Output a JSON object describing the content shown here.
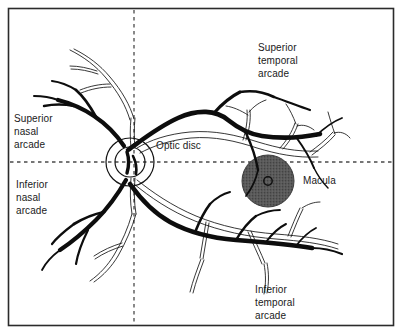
{
  "figure": {
    "border_color": "#2b2b2b",
    "background_color": "#ffffff",
    "vessel_color": "#111111",
    "dashed_line_color": "#4a4a4a",
    "macula_fill_color": "#5a5a5a",
    "text_color": "#1a1a1a"
  },
  "labels": {
    "superior_nasal_arcade": "Superior\nnasal\narcade",
    "inferior_nasal_arcade": "Inferior\nnasal\narcade",
    "superior_temporal_arcade": "Superior\ntemporal\narcade",
    "inferior_temporal_arcade": "Inferior\ntemporal\narcade",
    "optic_disc": "Optic disc",
    "macula": "Macula"
  },
  "structures": {
    "optic_disc": {
      "center_x": 130,
      "center_y": 162,
      "outer_radius": 24,
      "inner_radius": 15
    },
    "macula": {
      "center_x": 268,
      "center_y": 181,
      "radius": 26,
      "fovea_radius": 4
    },
    "vertical_meridian_x": 134,
    "horizontal_meridian_y": 162
  }
}
